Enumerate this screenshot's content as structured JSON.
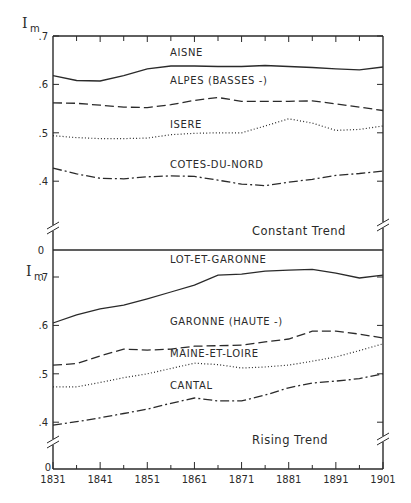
{
  "chart_data": [
    {
      "type": "line",
      "title": "Constant Trend",
      "ylabel": "I_m",
      "xlabel": "",
      "ylim": [
        0.3,
        0.7
      ],
      "y_break": true,
      "y_ticks": [
        ".7",
        ".6",
        ".5",
        ".4",
        "0"
      ],
      "x": [
        1831,
        1836,
        1841,
        1846,
        1851,
        1856,
        1861,
        1866,
        1871,
        1876,
        1881,
        1886,
        1891,
        1896,
        1901
      ],
      "series": [
        {
          "name": "AISNE",
          "style": "solid",
          "values": [
            0.618,
            0.608,
            0.607,
            0.618,
            0.632,
            0.638,
            0.638,
            0.637,
            0.637,
            0.639,
            0.637,
            0.635,
            0.632,
            0.63,
            0.636
          ]
        },
        {
          "name": "ALPES (BASSES-)",
          "style": "dashed",
          "values": [
            0.562,
            0.561,
            0.557,
            0.553,
            0.552,
            0.558,
            0.567,
            0.573,
            0.565,
            0.565,
            0.565,
            0.566,
            0.56,
            0.553,
            0.546
          ]
        },
        {
          "name": "ISERE",
          "style": "dotted",
          "values": [
            0.494,
            0.49,
            0.488,
            0.488,
            0.489,
            0.496,
            0.499,
            0.5,
            0.5,
            0.514,
            0.529,
            0.52,
            0.505,
            0.507,
            0.514
          ]
        },
        {
          "name": "COTES-DU-NORD",
          "style": "dashdot",
          "values": [
            0.427,
            0.415,
            0.406,
            0.405,
            0.409,
            0.411,
            0.41,
            0.402,
            0.394,
            0.391,
            0.398,
            0.404,
            0.412,
            0.416,
            0.421
          ]
        }
      ],
      "label_positions": {
        "AISNE": 0.658,
        "ALPES (BASSES-)": 0.6,
        "ISERE": 0.51,
        "COTES-DU-NORD": 0.428
      }
    },
    {
      "type": "line",
      "title": "Rising Trend",
      "ylabel": "I_m",
      "xlabel": "",
      "ylim": [
        0.35,
        0.75
      ],
      "y_break": true,
      "y_ticks": [
        "0",
        ".7",
        ".6",
        ".5",
        ".4",
        "0"
      ],
      "x_tick_labels": [
        "1831",
        "1841",
        "1851",
        "1861",
        "1871",
        "1881",
        "1891",
        "1901"
      ],
      "x": [
        1831,
        1836,
        1841,
        1846,
        1851,
        1856,
        1861,
        1866,
        1871,
        1876,
        1881,
        1886,
        1891,
        1896,
        1901
      ],
      "series": [
        {
          "name": "LOT-ET-GARONNE",
          "style": "solid",
          "values": [
            0.605,
            0.622,
            0.634,
            0.642,
            0.655,
            0.669,
            0.683,
            0.704,
            0.706,
            0.712,
            0.714,
            0.716,
            0.708,
            0.698,
            0.704
          ]
        },
        {
          "name": "GARONNE (HAUTE-)",
          "style": "dashed",
          "values": [
            0.518,
            0.521,
            0.537,
            0.551,
            0.549,
            0.551,
            0.557,
            0.558,
            0.559,
            0.566,
            0.572,
            0.588,
            0.588,
            0.582,
            0.574
          ]
        },
        {
          "name": "MAINE-ET-LOIRE",
          "style": "dotted",
          "values": [
            0.473,
            0.473,
            0.482,
            0.492,
            0.5,
            0.511,
            0.522,
            0.519,
            0.512,
            0.514,
            0.518,
            0.526,
            0.535,
            0.548,
            0.562
          ]
        },
        {
          "name": "CANTAL",
          "style": "dashdot",
          "values": [
            0.394,
            0.401,
            0.409,
            0.418,
            0.427,
            0.439,
            0.45,
            0.444,
            0.444,
            0.456,
            0.471,
            0.481,
            0.485,
            0.49,
            0.5
          ]
        }
      ],
      "label_positions": {
        "LOT-ET-GARONNE": 0.728,
        "GARONNE (HAUTE-)": 0.6,
        "MAINE-ET-LOIRE": 0.535,
        "CANTAL": 0.468
      }
    }
  ],
  "labels": {
    "ylabel_main": "I",
    "ylabel_sub": "m",
    "top_title": "Constant Trend",
    "bottom_title": "Rising Trend",
    "top_ticks": [
      ".7",
      ".6",
      ".5",
      ".4"
    ],
    "bottom_ticks": [
      ".7",
      ".6",
      ".5",
      ".4"
    ],
    "zero": "0"
  }
}
